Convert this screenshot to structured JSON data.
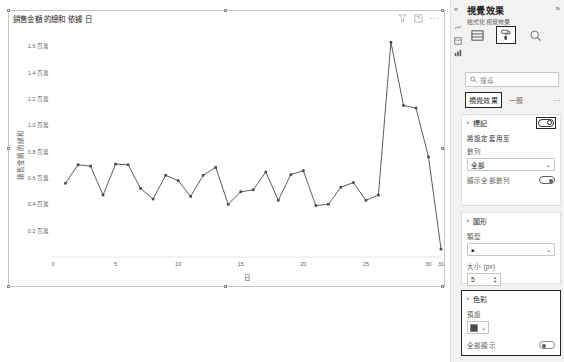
{
  "visual": {
    "title": "銷售金額 的總和 依據 日",
    "toolbar": {
      "filter_icon": "filter-icon",
      "focus_icon": "focus-mode-icon",
      "more_label": "···"
    }
  },
  "chart_data": {
    "type": "line",
    "title": "銷售金額 的總和 依據 日",
    "xlabel": "日",
    "ylabel": "銷售金額 的總和",
    "xlim": [
      0,
      31
    ],
    "ylim": [
      0,
      1700000
    ],
    "grid": false,
    "legend": "none",
    "marker": "square",
    "line_color": "#4c4a48",
    "x_ticks": [
      "0",
      "5",
      "10",
      "15",
      "20",
      "25",
      "30",
      "31"
    ],
    "x_tick_values": [
      0,
      5,
      10,
      15,
      20,
      25,
      30,
      31
    ],
    "y_ticks": [
      "1.6 百萬",
      "1.4 百萬",
      "1.2 百萬",
      "1.0 百萬",
      "0.8 百萬",
      "0.6 百萬",
      "0.4 百萬",
      "0.2 百萬"
    ],
    "y_tick_values": [
      1600000,
      1400000,
      1200000,
      1000000,
      800000,
      600000,
      400000,
      200000
    ],
    "x": [
      1,
      2,
      3,
      4,
      5,
      6,
      7,
      8,
      9,
      10,
      11,
      12,
      13,
      14,
      15,
      16,
      17,
      18,
      19,
      20,
      21,
      22,
      23,
      24,
      25,
      26,
      27,
      28,
      29,
      30,
      31
    ],
    "values": [
      560000,
      700000,
      690000,
      470000,
      705000,
      700000,
      520000,
      440000,
      620000,
      580000,
      460000,
      620000,
      680000,
      400000,
      495000,
      510000,
      645000,
      430000,
      625000,
      655000,
      390000,
      400000,
      530000,
      565000,
      430000,
      470000,
      1630000,
      1150000,
      1130000,
      760000,
      60000
    ]
  },
  "pane": {
    "collapse_left_icon": "chevron-double-left-icon",
    "title": "視覺效果",
    "collapse_right_icon": "chevron-double-right-icon",
    "subtitle": "格式化視覺效果",
    "rail_icons": [
      "build-visual-icon",
      "fields-icon",
      "analytics-icon"
    ],
    "format_tabs": [
      {
        "name": "build-visual-tab",
        "icon": "table-icon",
        "active": false
      },
      {
        "name": "format-visual-tab",
        "icon": "paint-roller-icon",
        "active": true
      },
      {
        "name": "analytics-tab",
        "icon": "magnifier-icon",
        "active": false
      }
    ],
    "search": {
      "icon": "search-icon",
      "placeholder": "搜尋",
      "value": ""
    },
    "pivot": {
      "visual_tab": "視覺效果",
      "general_tab": "一般",
      "more": "···",
      "selected": "視覺效果"
    },
    "cards": {
      "markers": {
        "chevron": "˅",
        "title": "標記",
        "toggle": "on",
        "apply_to_label": "將設定套用至",
        "series_label": "數列",
        "series_value": "全部",
        "show_all_label": "顯示全部數列",
        "show_all_toggle": "on"
      },
      "shape": {
        "chevron": "˅",
        "title": "圖形",
        "type_label": "類型",
        "type_value": "■",
        "size_label": "大小 (px)",
        "size_value": "5"
      },
      "color": {
        "chevron": "˅",
        "title": "色彩",
        "default_label": "預設",
        "default_color": "#4a4a4a",
        "show_all_label": "全部顯示",
        "show_all_toggle": "off"
      }
    }
  }
}
